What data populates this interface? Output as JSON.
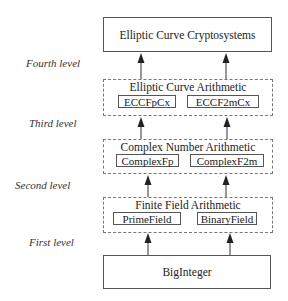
{
  "diagram": {
    "levels": [
      {
        "label": "Fourth level"
      },
      {
        "label": "Third level"
      },
      {
        "label": "Second level"
      },
      {
        "label": "First level"
      }
    ],
    "top_box": {
      "label": "Elliptic Curve Cryptosystems"
    },
    "groups": [
      {
        "title": "Elliptic Curve Arithmetic",
        "items": [
          "ECCFpCx",
          "ECCF2mCx"
        ]
      },
      {
        "title": "Complex Number Arithmetic",
        "items": [
          "ComplexFp",
          "ComplexF2m"
        ]
      },
      {
        "title": "Finite Field Arithmetic",
        "items": [
          "PrimeField",
          "BinaryField"
        ]
      }
    ],
    "bottom_box": {
      "label": "BigInteger"
    },
    "colors": {
      "line": "#555555",
      "dashed": "#777777",
      "arrow": "#222222"
    }
  }
}
